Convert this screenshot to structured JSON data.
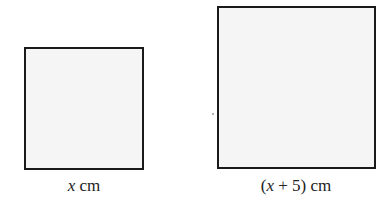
{
  "figure": {
    "small_square": {
      "label_var": "x",
      "label_unit": " cm",
      "fill": "#f5f5f5",
      "stroke": "#1a1a1a"
    },
    "large_square": {
      "label_prefix": "(",
      "label_var": "x",
      "label_rest": " + 5) cm",
      "fill": "#f5f5f5",
      "stroke": "#1a1a1a"
    }
  }
}
